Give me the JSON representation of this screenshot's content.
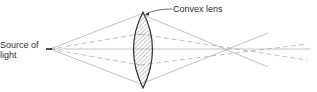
{
  "labels": {
    "source_line1": "Source of",
    "source_line2": "light",
    "lens": "Convex lens"
  },
  "colors": {
    "ray": "#9a9a9a",
    "lens_outline": "#333333",
    "hatch": "#777777",
    "text": "#333333"
  }
}
